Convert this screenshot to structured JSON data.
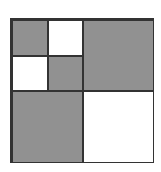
{
  "diagram": {
    "type": "nested-square-subdivision",
    "outer_square": {
      "x": 10,
      "y": 18,
      "width": 144,
      "height": 145
    },
    "colors": {
      "line": "#333333",
      "shaded": "#b8b8b8",
      "plain": "#ffffff"
    },
    "cells": [
      {
        "id": "top-left-small-a",
        "x": 0,
        "y": 0,
        "w": 36,
        "h": 36,
        "fill": "shaded"
      },
      {
        "id": "top-left-small-b",
        "x": 36,
        "y": 0,
        "w": 35,
        "h": 36,
        "fill": "plain"
      },
      {
        "id": "top-left-small-c",
        "x": 0,
        "y": 36,
        "w": 36,
        "h": 35,
        "fill": "plain"
      },
      {
        "id": "top-left-small-d",
        "x": 36,
        "y": 36,
        "w": 35,
        "h": 35,
        "fill": "shaded"
      },
      {
        "id": "top-right-quadrant",
        "x": 71,
        "y": 0,
        "w": 71,
        "h": 71,
        "fill": "shaded"
      },
      {
        "id": "bottom-left-quadrant",
        "x": 0,
        "y": 71,
        "w": 71,
        "h": 72,
        "fill": "shaded"
      },
      {
        "id": "bottom-right-quadrant",
        "x": 71,
        "y": 71,
        "w": 71,
        "h": 72,
        "fill": "plain"
      }
    ]
  }
}
